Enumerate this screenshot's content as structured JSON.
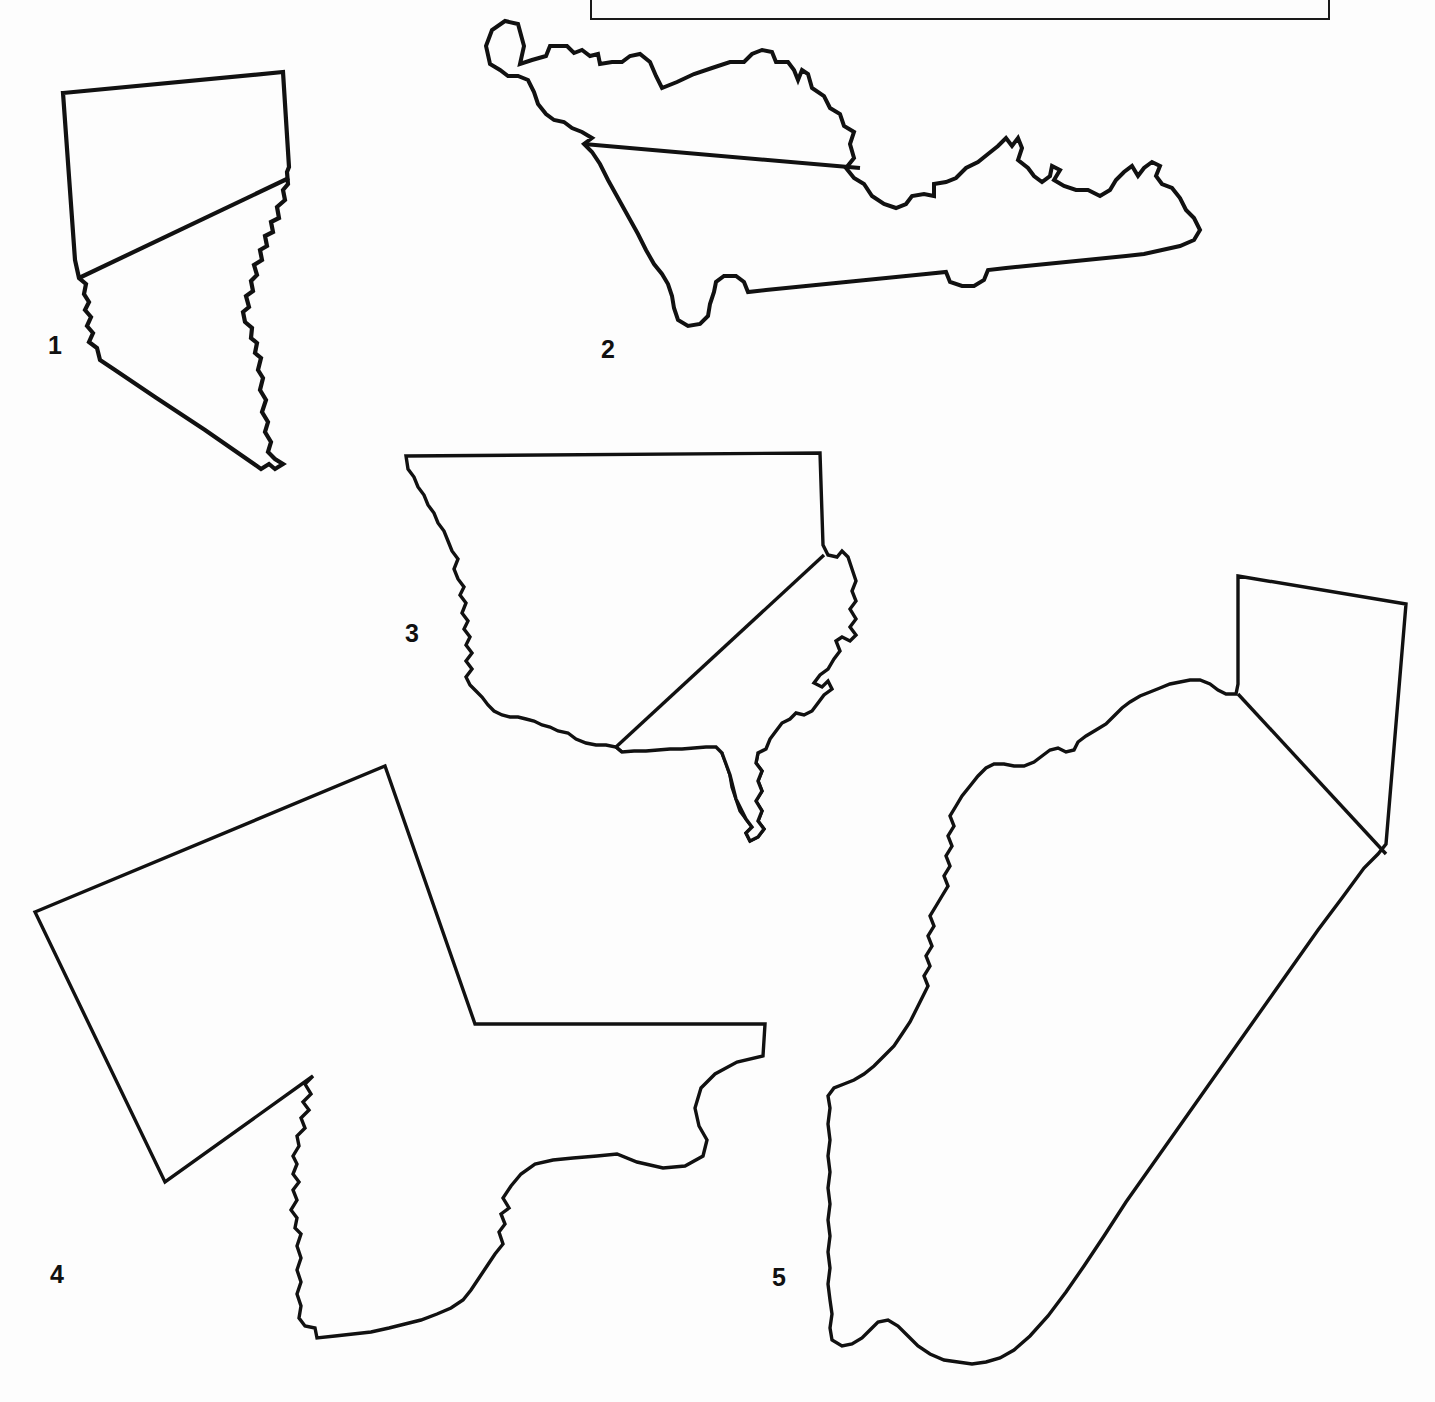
{
  "page": {
    "background_color": "#fdfdfd",
    "outline_color": "#111111",
    "width": 1435,
    "height": 1402
  },
  "answer_box": {
    "name": "answer-box",
    "faint_text": "",
    "border_color": "#1a1a1a"
  },
  "shapes": [
    {
      "number": "1",
      "label_x": 48,
      "label_y": 333,
      "description": "state-outline-1",
      "stroke_width": 4.2
    },
    {
      "number": "2",
      "label_x": 601,
      "label_y": 337,
      "description": "state-outline-2",
      "stroke_width": 4.0
    },
    {
      "number": "3",
      "label_x": 405,
      "label_y": 621,
      "description": "country-outline-3",
      "stroke_width": 3.4
    },
    {
      "number": "4",
      "label_x": 50,
      "label_y": 1262,
      "description": "state-outline-4",
      "stroke_width": 3.4
    },
    {
      "number": "5",
      "label_x": 772,
      "label_y": 1265,
      "description": "state-outline-5",
      "stroke_width": 3.4
    }
  ]
}
